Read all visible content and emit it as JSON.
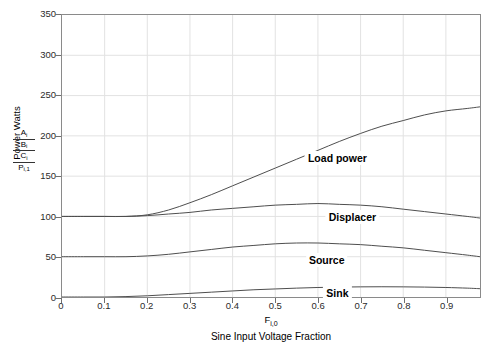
{
  "chart_data": {
    "type": "line",
    "title": "",
    "xlabel": "Sine Input Voltage Fraction",
    "xlabel_symbol": "F",
    "xlabel_symbol_sub": "i,0",
    "ylabel": "Power Watts",
    "ylabel_symbols": [
      "A",
      "B",
      "C",
      "P"
    ],
    "ylabel_symbol_subs": [
      "i",
      "i",
      "i",
      "i,1"
    ],
    "xlim": [
      0,
      0.98
    ],
    "ylim": [
      0,
      350
    ],
    "xticks": [
      "0",
      "0.1",
      "0.2",
      "0.3",
      "0.4",
      "0.5",
      "0.6",
      "0.7",
      "0.8",
      "0.9"
    ],
    "xtick_values": [
      0,
      0.1,
      0.2,
      0.3,
      0.4,
      0.5,
      0.6,
      0.7,
      0.8,
      0.9
    ],
    "yticks": [
      "0",
      "50",
      "100",
      "150",
      "200",
      "250",
      "300",
      "350"
    ],
    "ytick_values": [
      0,
      50,
      100,
      150,
      200,
      250,
      300,
      350
    ],
    "grid": true,
    "grid_color": "#e2e2e2",
    "axis_color": "#8a8a8a",
    "line_color": "#4d4d4d",
    "legend_position": "inline-annotations",
    "x": [
      0,
      0.05,
      0.1,
      0.15,
      0.2,
      0.25,
      0.3,
      0.35,
      0.4,
      0.45,
      0.5,
      0.55,
      0.6,
      0.65,
      0.7,
      0.75,
      0.8,
      0.85,
      0.9,
      0.95,
      0.98
    ],
    "series": [
      {
        "name": "Load power",
        "label": "Load power",
        "label_x": 0.645,
        "label_y": 172,
        "values": [
          100,
          100,
          100,
          100,
          102,
          108,
          117,
          127,
          138,
          149,
          160,
          171,
          182,
          193,
          203,
          212,
          219,
          226,
          231,
          234,
          236
        ]
      },
      {
        "name": "Displacer",
        "label": "Displacer",
        "label_x": 0.68,
        "label_y": 100,
        "values": [
          100,
          100,
          100,
          100,
          101,
          103,
          105,
          108,
          110,
          112,
          114,
          115,
          116,
          115,
          114,
          112,
          109,
          106,
          103,
          100,
          98
        ]
      },
      {
        "name": "Source",
        "label": "Source",
        "label_x": 0.62,
        "label_y": 47,
        "values": [
          50,
          50,
          50,
          50,
          51,
          53,
          56,
          59,
          62,
          64,
          66,
          67,
          67,
          66,
          65,
          63,
          61,
          58,
          55,
          52,
          50
        ]
      },
      {
        "name": "Sink",
        "label": "Sink",
        "label_x": 0.645,
        "label_y": 6,
        "values": [
          0,
          0,
          0,
          0.5,
          1.5,
          3,
          4.5,
          6,
          7.5,
          9,
          10,
          11,
          11.8,
          12.3,
          12.6,
          12.7,
          12.6,
          12.3,
          11.8,
          11,
          10.3
        ]
      }
    ]
  }
}
